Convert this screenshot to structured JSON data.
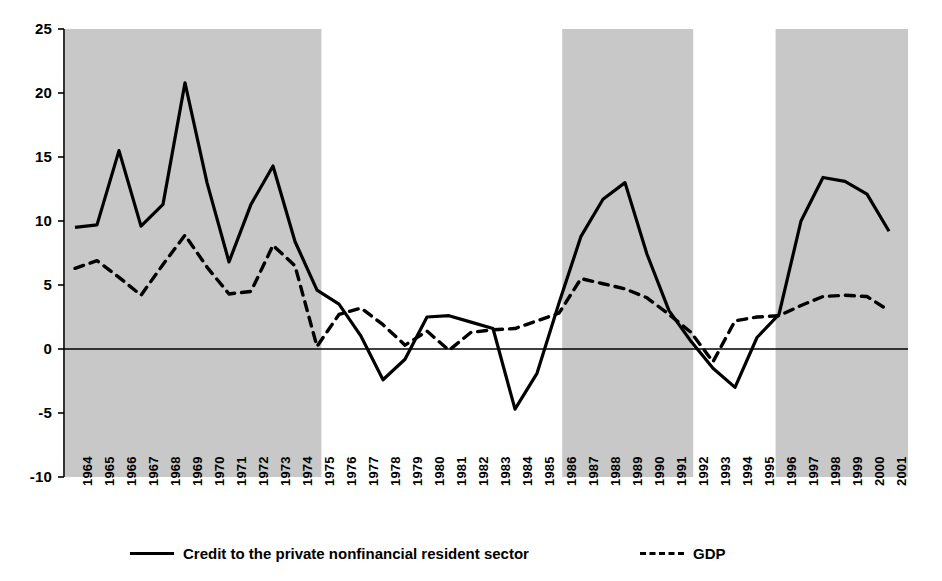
{
  "chart_data": {
    "type": "line",
    "title": "",
    "subtitle": "",
    "xlabel": "",
    "ylabel": "",
    "ylim": [
      -10,
      25
    ],
    "yticks": [
      25,
      20,
      15,
      10,
      5,
      0,
      -5,
      -10
    ],
    "ytick_labels": [
      "25",
      "20",
      "15",
      "10",
      "5",
      "0",
      "-5",
      "-10"
    ],
    "grid": false,
    "legend_position": "bottom",
    "zero_line": true,
    "x": [
      1964,
      1965,
      1966,
      1967,
      1968,
      1969,
      1970,
      1971,
      1972,
      1973,
      1974,
      1975,
      1976,
      1977,
      1978,
      1979,
      1980,
      1981,
      1982,
      1983,
      1984,
      1985,
      1986,
      1987,
      1988,
      1989,
      1990,
      1991,
      1992,
      1993,
      1994,
      1995,
      1996,
      1997,
      1998,
      1999,
      2000,
      2001
    ],
    "xtick_labels": [
      "1964",
      "1965",
      "1966",
      "1967",
      "1968",
      "1969",
      "1970",
      "1971",
      "1972",
      "1973",
      "1974",
      "1975",
      "1976",
      "1977",
      "1978",
      "1979",
      "1980",
      "1981",
      "1982",
      "1983",
      "1984",
      "1985",
      "1986",
      "1987",
      "1988",
      "1989",
      "1990",
      "1991",
      "1992",
      "1993",
      "1994",
      "1995",
      "1996",
      "1997",
      "1998",
      "1999",
      "2000",
      "2001"
    ],
    "series": [
      {
        "name": "Credit to the private nonfinancial resident sector",
        "style": "solid",
        "color": "#000000",
        "values": [
          9.5,
          9.7,
          15.5,
          9.6,
          11.3,
          20.8,
          13.0,
          6.8,
          11.3,
          14.3,
          8.4,
          4.6,
          3.5,
          1.0,
          -2.4,
          -0.8,
          2.5,
          2.6,
          2.1,
          1.6,
          -4.7,
          -1.9,
          3.6,
          8.8,
          11.7,
          13.0,
          7.4,
          3.0,
          0.6,
          -1.5,
          -3.0,
          0.9,
          2.7,
          10.0,
          13.4,
          13.1,
          12.1,
          9.2
        ]
      },
      {
        "name": "GDP",
        "style": "dashed",
        "color": "#000000",
        "values": [
          6.3,
          6.9,
          5.6,
          4.2,
          6.6,
          8.9,
          6.4,
          4.3,
          4.5,
          8.1,
          6.5,
          0.2,
          2.7,
          3.2,
          1.9,
          0.3,
          1.4,
          -0.1,
          1.3,
          1.5,
          1.6,
          2.2,
          2.8,
          5.5,
          5.1,
          4.7,
          4.0,
          2.7,
          1.3,
          -1.0,
          2.2,
          2.5,
          2.6,
          3.4,
          4.1,
          4.2,
          4.1,
          3.0
        ]
      }
    ],
    "shaded_regions": [
      {
        "start": 1964,
        "end": 1974.7,
        "color": "#c8c8c8",
        "label": "credit-boom-1"
      },
      {
        "start": 1986.6,
        "end": 1991.6,
        "color": "#c8c8c8",
        "label": "credit-boom-2"
      },
      {
        "start": 1996.3,
        "end": 2001.8,
        "color": "#c8c8c8",
        "label": "credit-boom-3"
      }
    ]
  },
  "legend": {
    "entries": [
      {
        "label": "Credit to the private nonfinancial resident sector",
        "style": "solid"
      },
      {
        "label": "GDP",
        "style": "dashed"
      }
    ]
  }
}
